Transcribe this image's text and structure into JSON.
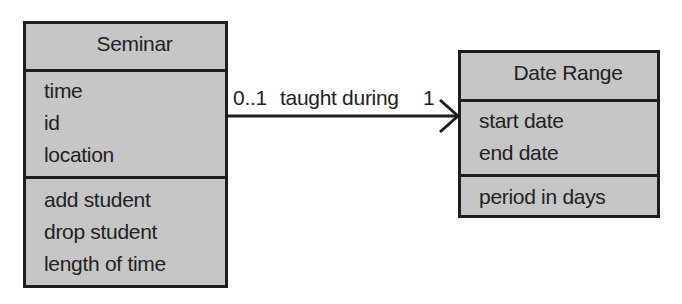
{
  "diagram": {
    "type": "UML class diagram",
    "classes": [
      {
        "id": "seminar",
        "name": "Seminar",
        "attributes": [
          "time",
          "id",
          "location"
        ],
        "operations": [
          "add student",
          "drop student",
          "length of time"
        ]
      },
      {
        "id": "daterange",
        "name": "Date Range",
        "attributes": [
          "start date",
          "end date"
        ],
        "operations": [
          "period in days"
        ]
      }
    ],
    "association": {
      "from": "Seminar",
      "to": "Date Range",
      "label": "taught during",
      "source_multiplicity": "0..1",
      "target_multiplicity": "1",
      "navigability": "open arrow toward Date Range"
    },
    "colors": {
      "box_fill": "#c6c6c6",
      "border": "#1e1e1e",
      "background": "#ffffff"
    }
  }
}
